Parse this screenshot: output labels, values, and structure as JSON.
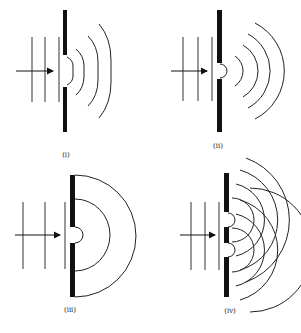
{
  "figure": {
    "colors": {
      "ink": "#111111",
      "background": "#ffffff"
    },
    "panels": [
      {
        "id": "i",
        "label": "(i)",
        "slits": 1,
        "slit_width": "wide",
        "wavefronts_in": 3,
        "wavefronts_out": 3
      },
      {
        "id": "ii",
        "label": "(ii)",
        "slits": 1,
        "slit_width": "narrow",
        "wavefronts_in": 3,
        "wavefronts_out": 4
      },
      {
        "id": "iii",
        "label": "(iii)",
        "slits": 1,
        "slit_width": "narrow",
        "wavefronts_in": 3,
        "wavefronts_out": 3
      },
      {
        "id": "iv",
        "label": "(iv)",
        "slits": 2,
        "slit_width": "narrow",
        "wavefronts_in": 3,
        "wavefronts_out": 8
      }
    ]
  }
}
